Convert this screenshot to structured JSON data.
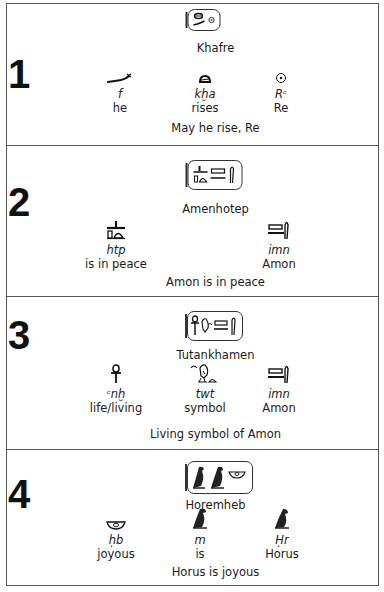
{
  "document": {
    "sections": [
      {
        "number": "1",
        "king": "Khafre",
        "cartouche_glyphs": [
          "placenta-glyph",
          "horned-viper-glyph",
          "sun-disk-glyph"
        ],
        "words": [
          {
            "glyph": "horned-viper",
            "translit": "f",
            "meaning": "he"
          },
          {
            "glyph": "placenta",
            "translit": "kḫa",
            "meaning": "rises"
          },
          {
            "glyph": "sun-disk",
            "translit": "Rᶜ",
            "meaning": "Re"
          }
        ],
        "translation": "May he rise, Re"
      },
      {
        "number": "2",
        "king": "Amenhotep",
        "cartouche_glyphs": [
          "offering-table-glyph",
          "game-board-glyph",
          "reed-leaf-glyph"
        ],
        "words": [
          {
            "glyph": "offering-table",
            "translit": "htp",
            "meaning": "is in peace"
          },
          {
            "glyph": "game-board-reed",
            "translit": "imn",
            "meaning": "Amon"
          }
        ],
        "translation": "Amon is in peace"
      },
      {
        "number": "3",
        "king": "Tutankhamen",
        "cartouche_glyphs": [
          "ankh-glyph",
          "chick-glyph",
          "game-board-glyph",
          "reed-leaf-glyph"
        ],
        "words": [
          {
            "glyph": "ankh",
            "translit": "ᶜnḫ",
            "meaning": "life/living"
          },
          {
            "glyph": "quail-chick",
            "translit": "twt",
            "meaning": "symbol"
          },
          {
            "glyph": "game-board-reed",
            "translit": "imn",
            "meaning": "Amon"
          }
        ],
        "translation": "Living symbol of Amon"
      },
      {
        "number": "4",
        "king": "Horemheb",
        "cartouche_glyphs": [
          "falcon-glyph",
          "owl-glyph",
          "alabaster-basin-glyph"
        ],
        "words": [
          {
            "glyph": "alabaster-basin",
            "translit": "ḥb",
            "meaning": "joyous"
          },
          {
            "glyph": "owl",
            "translit": "m",
            "meaning": "is"
          },
          {
            "glyph": "falcon",
            "translit": "Ḥr",
            "meaning": "Horus"
          }
        ],
        "translation": "Horus is joyous"
      }
    ]
  }
}
